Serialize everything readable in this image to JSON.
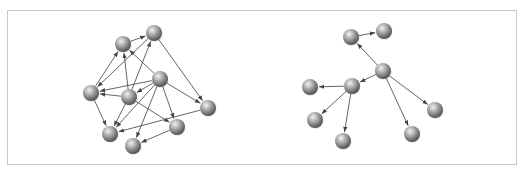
{
  "figure": {
    "colors": {
      "edge": "#555555",
      "node_light": "#f2f2f2",
      "node_mid": "#a6a6a6",
      "node_dark": "#4d4d4d",
      "frame": "#c8c8c8"
    },
    "node_radius": 8
  },
  "graphs": [
    {
      "name": "dense-graph",
      "nodes": [
        {
          "id": "A",
          "x": 123,
          "y": 44
        },
        {
          "id": "B",
          "x": 154,
          "y": 33
        },
        {
          "id": "C",
          "x": 91,
          "y": 93
        },
        {
          "id": "D",
          "x": 129,
          "y": 97
        },
        {
          "id": "E",
          "x": 160,
          "y": 79
        },
        {
          "id": "F",
          "x": 110,
          "y": 134
        },
        {
          "id": "G",
          "x": 133,
          "y": 146
        },
        {
          "id": "H",
          "x": 177,
          "y": 127
        },
        {
          "id": "I",
          "x": 208,
          "y": 108
        }
      ],
      "edges": [
        [
          "A",
          "B"
        ],
        [
          "C",
          "A"
        ],
        [
          "B",
          "C"
        ],
        [
          "D",
          "A"
        ],
        [
          "D",
          "B"
        ],
        [
          "E",
          "A"
        ],
        [
          "E",
          "C"
        ],
        [
          "E",
          "D"
        ],
        [
          "D",
          "C"
        ],
        [
          "B",
          "I"
        ],
        [
          "E",
          "I"
        ],
        [
          "C",
          "F"
        ],
        [
          "D",
          "F"
        ],
        [
          "E",
          "F"
        ],
        [
          "E",
          "G"
        ],
        [
          "E",
          "H"
        ],
        [
          "D",
          "H"
        ],
        [
          "I",
          "F"
        ],
        [
          "H",
          "G"
        ]
      ]
    },
    {
      "name": "tree-graph",
      "nodes": [
        {
          "id": "R1",
          "x": 351,
          "y": 37
        },
        {
          "id": "R2",
          "x": 384,
          "y": 31
        },
        {
          "id": "R3",
          "x": 383,
          "y": 71
        },
        {
          "id": "R4",
          "x": 352,
          "y": 86
        },
        {
          "id": "R5",
          "x": 310,
          "y": 87
        },
        {
          "id": "R6",
          "x": 315,
          "y": 120
        },
        {
          "id": "R7",
          "x": 343,
          "y": 141
        },
        {
          "id": "R8",
          "x": 412,
          "y": 134
        },
        {
          "id": "R9",
          "x": 435,
          "y": 110
        }
      ],
      "edges": [
        [
          "R1",
          "R2"
        ],
        [
          "R3",
          "R1"
        ],
        [
          "R3",
          "R4"
        ],
        [
          "R4",
          "R5"
        ],
        [
          "R4",
          "R6"
        ],
        [
          "R4",
          "R7"
        ],
        [
          "R3",
          "R8"
        ],
        [
          "R3",
          "R9"
        ]
      ]
    }
  ]
}
